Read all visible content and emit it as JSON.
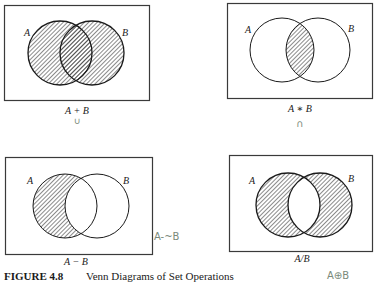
{
  "figure": {
    "caption_label": "FIGURE 4.8",
    "caption_title": "Venn Diagrams of Set Operations"
  },
  "colors": {
    "ink": "#1a1a1a",
    "frame": "#3a3a3a",
    "hatch": "#2a2a2a",
    "handwriting": "#7a8a7a"
  },
  "diagrams": [
    {
      "id": "union",
      "set_a_label": "A",
      "set_b_label": "B",
      "operation_label": "A + B",
      "handwritten_note": "∪",
      "shaded_region": "A or B"
    },
    {
      "id": "intersection",
      "set_a_label": "A",
      "set_b_label": "B",
      "operation_label": "A ∗ B",
      "handwritten_note": "∩",
      "shaded_region": "A and B"
    },
    {
      "id": "difference",
      "set_a_label": "A",
      "set_b_label": "B",
      "operation_label": "A − B",
      "handwritten_note": "A-~B",
      "shaded_region": "A only"
    },
    {
      "id": "symmetric-difference",
      "set_a_label": "A",
      "set_b_label": "B",
      "operation_label": "A/B",
      "handwritten_note": "A⊕B",
      "shaded_region": "A xor B"
    }
  ]
}
